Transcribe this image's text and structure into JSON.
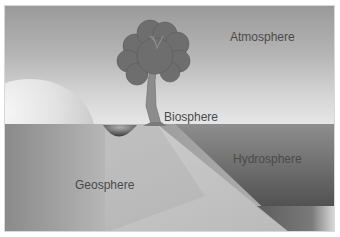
{
  "diagram": {
    "labels": {
      "atmosphere": "Atmosphere",
      "biosphere": "Biosphere",
      "hydrosphere": "Hydrosphere",
      "geosphere": "Geosphere"
    },
    "colors": {
      "sky_top": "#9a9a9a",
      "sky_bottom": "#e6e6e6",
      "tree_canopy": "#6e6e6e",
      "trunk": "#8c8c8c",
      "water_dark": "#5a5a5a",
      "land_slope": "#c4c4c4",
      "label_text": "#4a4a4a"
    }
  }
}
